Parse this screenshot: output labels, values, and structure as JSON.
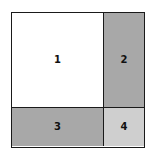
{
  "diagram": {
    "type": "partitioned-square",
    "cells": [
      {
        "label": "1",
        "fill": "#ffffff"
      },
      {
        "label": "2",
        "fill": "#a8a8a8"
      },
      {
        "label": "3",
        "fill": "#a8a8a8"
      },
      {
        "label": "4",
        "fill": "#cfcfcf"
      }
    ],
    "border_color": "#1a1a1a"
  }
}
